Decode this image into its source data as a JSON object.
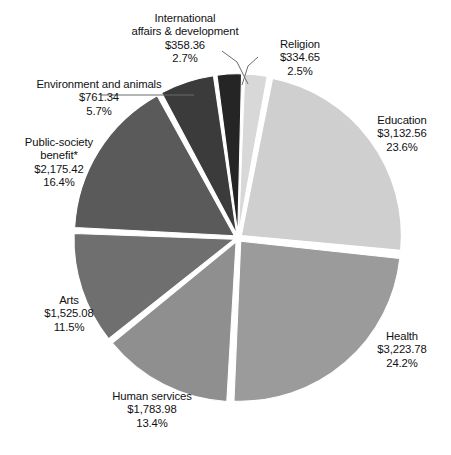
{
  "chart_data": {
    "type": "pie",
    "title": "",
    "subtitle": "",
    "legend_position": "outside-labels",
    "grid": false,
    "value_prefix": "$",
    "footnote_marker": "*",
    "total_value": 13295.17,
    "categories": [
      "Religion",
      "Education",
      "Health",
      "Human services",
      "Arts",
      "Public-society benefit*",
      "Environment and animals",
      "International affairs & development"
    ],
    "values": [
      334.65,
      3132.56,
      3223.78,
      1783.98,
      1525.08,
      2175.42,
      761.34,
      358.36
    ],
    "percents": [
      2.5,
      23.6,
      24.2,
      13.4,
      11.5,
      16.4,
      5.7,
      2.7
    ],
    "colors": [
      "#d8d8d8",
      "#cfcfcf",
      "#9b9b9b",
      "#8f8f8f",
      "#6f6f6f",
      "#5a5a5a",
      "#3b3b3b",
      "#252525"
    ],
    "slices": [
      {
        "name": "religion",
        "label": "Religion",
        "value_text": "$334.65",
        "percent_text": "2.5%",
        "value": 334.65,
        "percent": 2.5,
        "color": "#d8d8d8"
      },
      {
        "name": "education",
        "label": "Education",
        "value_text": "$3,132.56",
        "percent_text": "23.6%",
        "value": 3132.56,
        "percent": 23.6,
        "color": "#cfcfcf"
      },
      {
        "name": "health",
        "label": "Health",
        "value_text": "$3,223.78",
        "percent_text": "24.2%",
        "value": 3223.78,
        "percent": 24.2,
        "color": "#9b9b9b"
      },
      {
        "name": "human-services",
        "label": "Human services",
        "value_text": "$1,783.98",
        "percent_text": "13.4%",
        "value": 1783.98,
        "percent": 13.4,
        "color": "#8f8f8f"
      },
      {
        "name": "arts",
        "label": "Arts",
        "value_text": "$1,525.08",
        "percent_text": "11.5%",
        "value": 1525.08,
        "percent": 11.5,
        "color": "#6f6f6f"
      },
      {
        "name": "public-society-benefit",
        "label_line1": "Public-society",
        "label_line2": "benefit*",
        "label": "Public-society benefit*",
        "value_text": "$2,175.42",
        "percent_text": "16.4%",
        "value": 2175.42,
        "percent": 16.4,
        "color": "#5a5a5a"
      },
      {
        "name": "environment-and-animals",
        "label": "Environment and animals",
        "value_text": "$761.34",
        "percent_text": "5.7%",
        "value": 761.34,
        "percent": 5.7,
        "color": "#3b3b3b"
      },
      {
        "name": "international-affairs-and-development",
        "label_line1": "International",
        "label_line2": "affairs & development",
        "label": "International affairs & development",
        "value_text": "$358.36",
        "percent_text": "2.7%",
        "value": 358.36,
        "percent": 2.7,
        "color": "#252525"
      }
    ]
  },
  "labels": {
    "international": {
      "line1": "International",
      "line2": "affairs & development",
      "line3": "$358.36",
      "line4": "2.7%"
    },
    "religion": {
      "line1": "Religion",
      "line2": "$334.65",
      "line3": "2.5%"
    },
    "environment": {
      "line1": "Environment and animals",
      "line2": "$761.34",
      "line3": "5.7%"
    },
    "public": {
      "line1": "Public-society",
      "line2": "benefit*",
      "line3": "$2,175.42",
      "line4": "16.4%"
    },
    "education": {
      "line1": "Education",
      "line2": "$3,132.56",
      "line3": "23.6%"
    },
    "health": {
      "line1": "Health",
      "line2": "$3,223.78",
      "line3": "24.2%"
    },
    "arts": {
      "line1": "Arts",
      "line2": "$1,525.08",
      "line3": "11.5%"
    },
    "human": {
      "line1": "Human services",
      "line2": "$1,783.98",
      "line3": "13.4%"
    }
  }
}
